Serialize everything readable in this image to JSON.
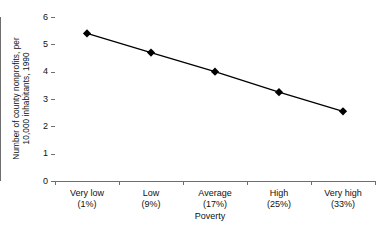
{
  "chart_data": {
    "type": "line",
    "title": "",
    "xlabel": "Poverty",
    "ylabel": "Number of county nonprofits, per 10,000 inhabitants, 1990",
    "ylabel_line1": "Number of county nonprofits, per",
    "ylabel_line2": "10,000 inhabitants, 1990",
    "categories": [
      "Very low",
      "Low",
      "Average",
      "High",
      "Very high"
    ],
    "category_percents": [
      "(1%)",
      "(9%)",
      "(17%)",
      "(25%)",
      "(33%)"
    ],
    "values": [
      5.4,
      4.7,
      4.0,
      3.25,
      2.55
    ],
    "ylim": [
      0,
      6
    ],
    "yticks": [
      0,
      1,
      2,
      3,
      4,
      5,
      6
    ],
    "ytick_labels": [
      "0",
      "1",
      "2",
      "3",
      "4",
      "5",
      "6"
    ],
    "grid": false,
    "legend": "none",
    "marker": "diamond",
    "series_color": "#000000",
    "axis_color": "#6e6e6e",
    "text_color": "#111111",
    "background": "#ffffff"
  }
}
